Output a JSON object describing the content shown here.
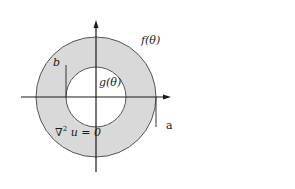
{
  "diagram": {
    "colors": {
      "annulus_fill": "#d9d9d9",
      "inner_fill": "#ffffff",
      "stroke": "#1a1a1a",
      "circle_stroke": "#555555"
    },
    "geometry": {
      "center": [
        96,
        97
      ],
      "outer_radius": 60,
      "inner_radius": 30
    },
    "labels": {
      "outer_boundary": "f(θ)",
      "inner_boundary": "g(θ)",
      "inner_radius_label": "b",
      "outer_radius_label": "a",
      "equation_nabla": "∇",
      "equation_exp": "2",
      "equation_rest": " u = 0"
    }
  }
}
